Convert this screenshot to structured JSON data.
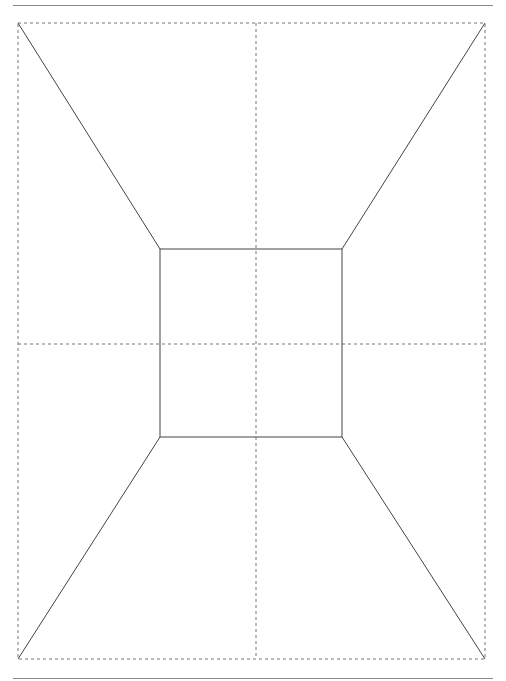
{
  "figure": {
    "type": "one-point perspective room wireframe",
    "frame": {
      "x1": 18,
      "y1": 23,
      "x2": 485,
      "y2": 659
    },
    "inner_rect": {
      "x1": 160,
      "y1": 249,
      "x2": 342,
      "y2": 437
    },
    "center_guides": {
      "cx": 256,
      "cy": 344
    },
    "colors": {
      "solid_line": "#444444",
      "dashed_line": "#777777",
      "rule": "#8a8a8a",
      "background": "#ffffff"
    }
  }
}
